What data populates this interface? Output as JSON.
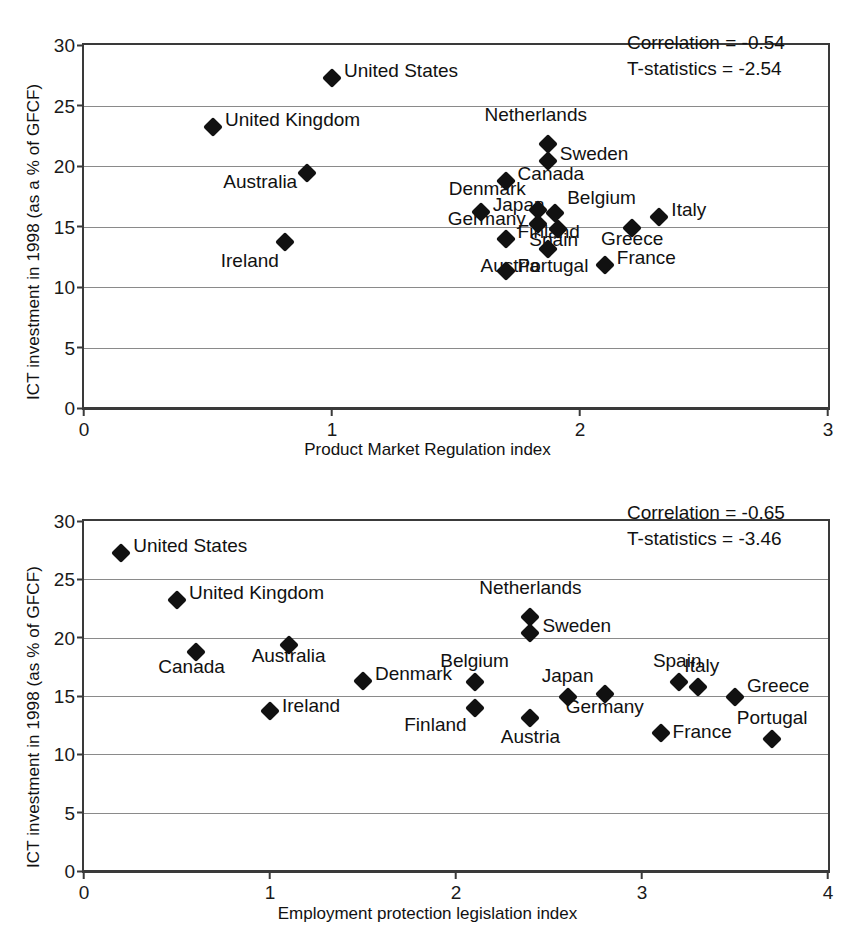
{
  "chart_data": [
    {
      "id": "top",
      "type": "scatter",
      "title": "",
      "xlabel": "Product Market Regulation index",
      "ylabel": "ICT investment in 1998 (as a % of GFCF)",
      "xlim": [
        0,
        3
      ],
      "ylim": [
        0,
        30
      ],
      "xticks": [
        "0",
        "1",
        "2",
        "3"
      ],
      "xtick_values": [
        0,
        1,
        2,
        3
      ],
      "yticks": [
        "0",
        "5",
        "10",
        "15",
        "20",
        "25",
        "30"
      ],
      "ytick_values": [
        0,
        5,
        10,
        15,
        20,
        25,
        30
      ],
      "grid": "horizontal",
      "annotations": [
        "Correlation = -0.54",
        "T-statistics = -2.54"
      ],
      "correlation": "-0.54",
      "t_statistics": "-2.54",
      "points": [
        {
          "label": "United States",
          "x": 1.0,
          "y": 27.3,
          "lx": 12,
          "ly": -8
        },
        {
          "label": "United Kingdom",
          "x": 0.52,
          "y": 23.2,
          "lx": 12,
          "ly": -8
        },
        {
          "label": "Netherlands",
          "x": 1.87,
          "y": 21.8,
          "lx": -12,
          "ly": -30,
          "anchor": "center"
        },
        {
          "label": "Sweden",
          "x": 1.87,
          "y": 20.4,
          "lx": 12,
          "ly": -8
        },
        {
          "label": "Australia",
          "x": 0.9,
          "y": 19.4,
          "lx": -10,
          "ly": 8,
          "anchor": "right"
        },
        {
          "label": "Canada",
          "x": 1.7,
          "y": 18.8,
          "lx": 12,
          "ly": -8
        },
        {
          "label": "Denmark",
          "x": 1.83,
          "y": 16.4,
          "lx": -12,
          "ly": -22,
          "anchor": "right"
        },
        {
          "label": "Japan",
          "x": 1.6,
          "y": 16.2,
          "lx": 12,
          "ly": -8
        },
        {
          "label": "Belgium",
          "x": 1.9,
          "y": 16.1,
          "lx": 12,
          "ly": -16
        },
        {
          "label": "Italy",
          "x": 2.32,
          "y": 15.8,
          "lx": 12,
          "ly": -8
        },
        {
          "label": "Germany",
          "x": 1.83,
          "y": 15.2,
          "lx": -12,
          "ly": -6,
          "anchor": "right"
        },
        {
          "label": "Spain",
          "x": 1.91,
          "y": 14.8,
          "lx": -4,
          "ly": 10,
          "anchor": "center"
        },
        {
          "label": "Finland",
          "x": 1.7,
          "y": 14.0,
          "lx": 12,
          "ly": -8
        },
        {
          "label": "Greece",
          "x": 2.21,
          "y": 14.9,
          "lx": 0,
          "ly": 10,
          "anchor": "center"
        },
        {
          "label": "Ireland",
          "x": 0.81,
          "y": 13.7,
          "lx": -6,
          "ly": 18,
          "anchor": "right"
        },
        {
          "label": "Austria",
          "x": 1.87,
          "y": 13.1,
          "lx": -8,
          "ly": 16,
          "anchor": "right"
        },
        {
          "label": "France",
          "x": 2.1,
          "y": 11.8,
          "lx": 12,
          "ly": -8
        },
        {
          "label": "Portugal",
          "x": 1.7,
          "y": 11.3,
          "lx": 12,
          "ly": -6
        }
      ]
    },
    {
      "id": "bottom",
      "type": "scatter",
      "title": "",
      "xlabel": "Employment protection legislation index",
      "ylabel": "ICT investment in 1998 (as % of GFCF)",
      "xlim": [
        0,
        4
      ],
      "ylim": [
        0,
        30
      ],
      "xticks": [
        "0",
        "1",
        "2",
        "3",
        "4"
      ],
      "xtick_values": [
        0,
        1,
        2,
        3,
        4
      ],
      "yticks": [
        "0",
        "5",
        "10",
        "15",
        "20",
        "25",
        "30"
      ],
      "ytick_values": [
        0,
        5,
        10,
        15,
        20,
        25,
        30
      ],
      "grid": "horizontal",
      "annotations": [
        "Correlation = -0.65",
        "T-statistics = -3.46"
      ],
      "correlation": "-0.65",
      "t_statistics": "-3.46",
      "points": [
        {
          "label": "United States",
          "x": 0.2,
          "y": 27.3,
          "lx": 12,
          "ly": -8
        },
        {
          "label": "United Kingdom",
          "x": 0.5,
          "y": 23.2,
          "lx": 12,
          "ly": -8
        },
        {
          "label": "Netherlands",
          "x": 2.4,
          "y": 21.8,
          "lx": 0,
          "ly": -30,
          "anchor": "center"
        },
        {
          "label": "Sweden",
          "x": 2.4,
          "y": 20.4,
          "lx": 12,
          "ly": -8
        },
        {
          "label": "Australia",
          "x": 1.1,
          "y": 19.4,
          "lx": 0,
          "ly": 10,
          "anchor": "center"
        },
        {
          "label": "Canada",
          "x": 0.6,
          "y": 18.8,
          "lx": -4,
          "ly": 14,
          "anchor": "center"
        },
        {
          "label": "Belgium",
          "x": 2.1,
          "y": 16.2,
          "lx": 0,
          "ly": -22,
          "anchor": "center"
        },
        {
          "label": "Denmark",
          "x": 1.5,
          "y": 16.3,
          "lx": 12,
          "ly": -8
        },
        {
          "label": "Spain",
          "x": 3.2,
          "y": 16.2,
          "lx": -2,
          "ly": -22,
          "anchor": "center"
        },
        {
          "label": "Italy",
          "x": 3.3,
          "y": 15.8,
          "lx": 4,
          "ly": -22,
          "anchor": "center"
        },
        {
          "label": "Japan",
          "x": 2.6,
          "y": 14.9,
          "lx": 0,
          "ly": -22,
          "anchor": "center"
        },
        {
          "label": "Germany",
          "x": 2.8,
          "y": 15.2,
          "lx": 0,
          "ly": 12,
          "anchor": "center"
        },
        {
          "label": "Greece",
          "x": 3.5,
          "y": 14.9,
          "lx": 12,
          "ly": -12
        },
        {
          "label": "Ireland",
          "x": 1.0,
          "y": 13.7,
          "lx": 12,
          "ly": -6
        },
        {
          "label": "Finland",
          "x": 2.1,
          "y": 14.0,
          "lx": -8,
          "ly": 16,
          "anchor": "right"
        },
        {
          "label": "Austria",
          "x": 2.4,
          "y": 13.1,
          "lx": 0,
          "ly": 18,
          "anchor": "center"
        },
        {
          "label": "France",
          "x": 3.1,
          "y": 11.8,
          "lx": 12,
          "ly": -2
        },
        {
          "label": "Portugal",
          "x": 3.7,
          "y": 11.3,
          "lx": 0,
          "ly": -22,
          "anchor": "center"
        }
      ]
    }
  ]
}
